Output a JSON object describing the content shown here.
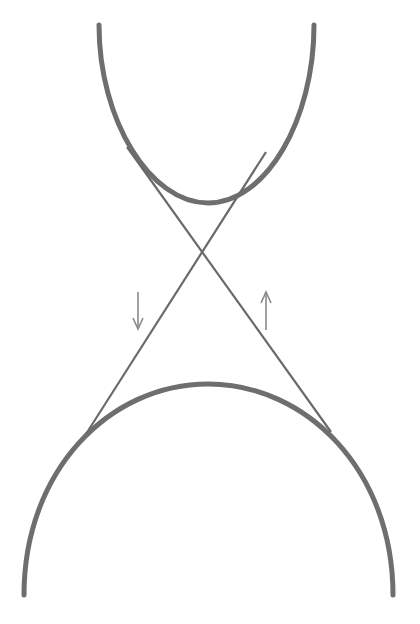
{
  "diagram": {
    "title": "",
    "type": "crossed-belt-drive",
    "colors": {
      "background": "#ffffff",
      "pulley_stroke": "#6e6e6e",
      "belt_stroke": "#6a6a6a",
      "arrow_stroke": "#8a8a8a"
    },
    "elements": {
      "upper_pulley": {
        "label": ""
      },
      "lower_pulley": {
        "label": ""
      },
      "belt_left_to_right": {
        "label": ""
      },
      "belt_right_to_left": {
        "label": ""
      },
      "arrow_down": {
        "glyph": "↓",
        "direction": "down"
      },
      "arrow_up": {
        "glyph": "↑",
        "direction": "up"
      }
    }
  }
}
